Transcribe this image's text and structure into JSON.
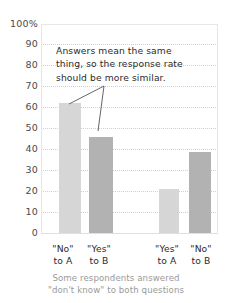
{
  "chart_data": {
    "type": "bar",
    "title": "",
    "xlabel": "",
    "ylabel": "",
    "ylim": [
      0,
      100
    ],
    "grid": true,
    "legend": "none",
    "categories": [
      "\"No\" to A",
      "\"Yes\" to B",
      "\"Yes\" to A",
      "\"No\" to B"
    ],
    "values": [
      62,
      46,
      21,
      39
    ],
    "bars": [
      {
        "label_line1": "\"No\"",
        "label_line2": "to A",
        "value": 62,
        "color": "#d6d6d6",
        "shade": "light"
      },
      {
        "label_line1": "\"Yes\"",
        "label_line2": "to B",
        "value": 46,
        "color": "#b2b2b2",
        "shade": "dark"
      },
      {
        "label_line1": "\"Yes\"",
        "label_line2": "to A",
        "value": 21,
        "color": "#d6d6d6",
        "shade": "light"
      },
      {
        "label_line1": "\"No\"",
        "label_line2": "to B",
        "value": 39,
        "color": "#b2b2b2",
        "shade": "dark"
      }
    ],
    "yticks": [
      {
        "value": 100,
        "label": "100%"
      },
      {
        "value": 90,
        "label": "90"
      },
      {
        "value": 80,
        "label": "80"
      },
      {
        "value": 70,
        "label": "70"
      },
      {
        "value": 60,
        "label": "60"
      },
      {
        "value": 50,
        "label": "50"
      },
      {
        "value": 40,
        "label": "40"
      },
      {
        "value": 30,
        "label": "30"
      },
      {
        "value": 20,
        "label": "20"
      },
      {
        "value": 10,
        "label": "10"
      },
      {
        "value": 0,
        "label": "0"
      }
    ],
    "annotations": [
      {
        "text": "Answers mean the same thing, so the response rate should be more similar.",
        "lines": [
          "Answers mean the same",
          "thing, so the response rate",
          "should be more similar."
        ],
        "points_to": [
          "\"No\" to A",
          "\"Yes\" to B"
        ]
      }
    ],
    "footnote_lines": [
      "Some respondents answered",
      "\"don't know\" to both questions"
    ]
  },
  "colors": {
    "bar_light": "#d6d6d6",
    "bar_dark": "#b2b2b2",
    "gridline": "#cfcfcf",
    "axis_text": "#4a4a4a",
    "annotation_text": "#2b2b2b",
    "footnote_text": "#9a9a9a",
    "background": "#ffffff",
    "leader_line": "#555555"
  }
}
